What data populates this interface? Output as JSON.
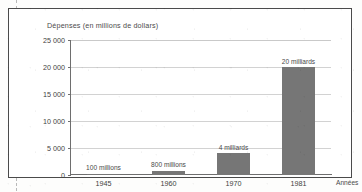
{
  "figure": {
    "title": "Dépenses (en millions de dollars)",
    "x_axis_title": "Années",
    "frame_color": "#4a4a4a",
    "bar_color": "#767676",
    "gridline_color": "#d2d2d2"
  },
  "chart_data": {
    "type": "bar",
    "title": "Dépenses (en millions de dollars)",
    "subtitle": "",
    "xlabel": "Années",
    "ylabel": "Dépenses (en millions de dollars)",
    "categories": [
      "1945",
      "1960",
      "1970",
      "1981"
    ],
    "values": [
      100,
      800,
      4000,
      20000
    ],
    "point_labels": [
      "100 millions",
      "800 millions",
      "4 milliards",
      "20 milliards"
    ],
    "ylim": [
      0,
      25000
    ],
    "yticks": [
      0,
      5000,
      10000,
      15000,
      20000,
      25000
    ],
    "ytick_labels": [
      "0",
      "5 000",
      "10 000",
      "15 000",
      "20 000",
      "25 000"
    ],
    "grid": true,
    "legend": false,
    "legend_position": "none",
    "series": [
      {
        "name": "Dépenses",
        "values": [
          100,
          800,
          4000,
          20000
        ]
      }
    ]
  }
}
